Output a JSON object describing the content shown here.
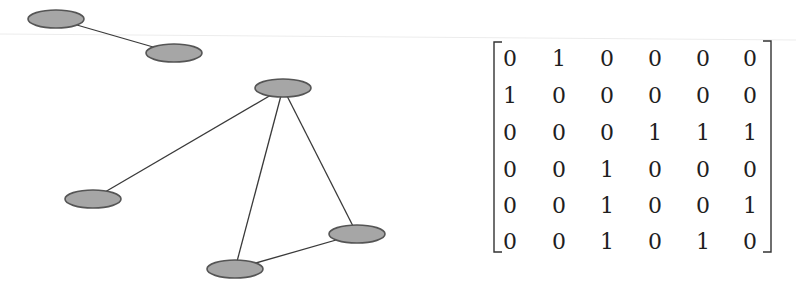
{
  "graph": {
    "nodes": [
      {
        "id": 1,
        "cx": 56,
        "cy": 19
      },
      {
        "id": 2,
        "cx": 174,
        "cy": 53
      },
      {
        "id": 3,
        "cx": 283,
        "cy": 88
      },
      {
        "id": 4,
        "cx": 93,
        "cy": 199
      },
      {
        "id": 5,
        "cx": 357,
        "cy": 234
      },
      {
        "id": 6,
        "cx": 235,
        "cy": 269
      }
    ],
    "edges": [
      [
        1,
        2
      ],
      [
        3,
        4
      ],
      [
        3,
        5
      ],
      [
        3,
        6
      ],
      [
        5,
        6
      ]
    ],
    "node_rx": 28,
    "node_ry": 9,
    "node_fill": "#a6a6a6",
    "node_stroke": "#555555"
  },
  "matrix": {
    "rows": [
      [
        "0",
        "1",
        "0",
        "0",
        "0",
        "0"
      ],
      [
        "1",
        "0",
        "0",
        "0",
        "0",
        "0"
      ],
      [
        "0",
        "0",
        "0",
        "1",
        "1",
        "1"
      ],
      [
        "0",
        "0",
        "1",
        "0",
        "0",
        "0"
      ],
      [
        "0",
        "0",
        "1",
        "0",
        "0",
        "1"
      ],
      [
        "0",
        "0",
        "1",
        "0",
        "1",
        "0"
      ]
    ],
    "col_x": [
      510,
      559,
      607,
      655,
      703,
      750
    ],
    "row_y": [
      66,
      103,
      140,
      177,
      213,
      249
    ]
  }
}
